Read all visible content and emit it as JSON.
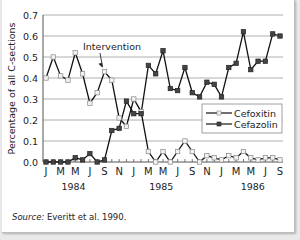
{
  "chart_data": {
    "type": "line",
    "title": "",
    "xlabel": "",
    "ylabel": "Percentage of all C-sections",
    "ylim": [
      0,
      0.7
    ],
    "yticks": [
      "0.0",
      "0.1",
      "0.2",
      "0.3",
      "0.4",
      "0.5",
      "0.6",
      "0.7"
    ],
    "grid": true,
    "legend_position": "lower-right inside plot",
    "x_month_labels": [
      "J",
      "M",
      "M",
      "J",
      "S",
      "N",
      "J",
      "M",
      "M",
      "J",
      "S",
      "N",
      "J",
      "M",
      "M",
      "J",
      "S"
    ],
    "year_labels": [
      "1984",
      "1985",
      "1986"
    ],
    "x": [
      "1984-01",
      "1984-02",
      "1984-03",
      "1984-04",
      "1984-05",
      "1984-06",
      "1984-07",
      "1984-08",
      "1984-09",
      "1984-10",
      "1984-11",
      "1984-12",
      "1985-01",
      "1985-02",
      "1985-03",
      "1985-04",
      "1985-05",
      "1985-06",
      "1985-07",
      "1985-08",
      "1985-09",
      "1985-10",
      "1985-11",
      "1985-12",
      "1986-01",
      "1986-02",
      "1986-03",
      "1986-04",
      "1986-05",
      "1986-06",
      "1986-07",
      "1986-08",
      "1986-09"
    ],
    "series": [
      {
        "name": "Cefoxitin",
        "marker": "open-square",
        "values": [
          0.4,
          0.5,
          0.41,
          0.39,
          0.52,
          0.42,
          0.28,
          0.33,
          0.43,
          0.39,
          0.21,
          0.17,
          0.3,
          0.24,
          0.05,
          0.0,
          0.05,
          0.0,
          0.05,
          0.1,
          0.05,
          0.0,
          0.03,
          0.02,
          0.01,
          0.03,
          0.02,
          0.05,
          0.02,
          0.01,
          0.02,
          0.02,
          0.01
        ]
      },
      {
        "name": "Cefazolin",
        "marker": "filled-square",
        "values": [
          0.0,
          0.0,
          0.0,
          0.0,
          0.02,
          0.01,
          0.04,
          0.0,
          0.01,
          0.15,
          0.16,
          0.29,
          0.23,
          0.23,
          0.46,
          0.42,
          0.53,
          0.35,
          0.34,
          0.45,
          0.33,
          0.31,
          0.38,
          0.37,
          0.31,
          0.45,
          0.47,
          0.62,
          0.44,
          0.48,
          0.48,
          0.61,
          0.6
        ]
      }
    ],
    "annotations": [
      {
        "text": "Intervention",
        "arrow_to": "1984-09"
      }
    ]
  },
  "source_label": "Source:",
  "source_text": " Everitt et al. 1990."
}
